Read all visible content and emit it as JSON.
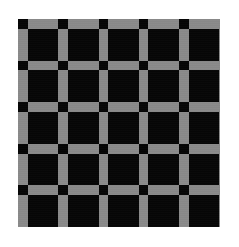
{
  "image": {
    "title": "Checkerboard Calibration Pattern",
    "kind": "checkerboard-calibration-target",
    "width": 239,
    "height": 247,
    "background_color": "#ffffff",
    "description": "Square grid calibration target: black squares on a gray field with black nodes at every line intersection"
  },
  "board": {
    "offset_x": 18,
    "offset_y": 19,
    "width": 202,
    "height": 208,
    "field_color": "#8a8a8a",
    "square_color": "#060606",
    "node_color": "#050505",
    "margin_color": "#ffffff"
  },
  "grid": {
    "columns": 5,
    "rows": 5,
    "intersections_x": 6,
    "intersections_y": 6,
    "cell_width": 30.8,
    "cell_height": 31.8,
    "line_width": 9.5,
    "line_height": 9.8,
    "node_width": 9.5,
    "node_height": 9.8,
    "pitch_x": 40.3,
    "pitch_y": 41.6
  },
  "chart_data": {
    "type": "heatmap",
    "xlabel": "",
    "ylabel": "",
    "grid": false,
    "legend": "none",
    "colormap": {
      "black": "#060606",
      "gray": "#8a8a8a",
      "white": "#ffffff"
    },
    "categories": [
      "c0",
      "c1",
      "c2",
      "c3",
      "c4"
    ],
    "x": [
      0,
      1,
      2,
      3,
      4
    ],
    "values": [
      [
        1,
        1,
        1,
        1,
        1
      ],
      [
        1,
        1,
        1,
        1,
        1
      ],
      [
        1,
        1,
        1,
        1,
        1
      ],
      [
        1,
        1,
        1,
        1,
        1
      ],
      [
        1,
        1,
        1,
        1,
        1
      ]
    ],
    "node_matrix": [
      [
        1,
        1,
        1,
        1,
        1,
        1
      ],
      [
        1,
        1,
        1,
        1,
        1,
        1
      ],
      [
        1,
        1,
        1,
        1,
        1,
        1
      ],
      [
        1,
        1,
        1,
        1,
        1,
        1
      ],
      [
        1,
        1,
        1,
        1,
        1,
        1
      ],
      [
        1,
        1,
        1,
        1,
        1,
        1
      ]
    ]
  }
}
